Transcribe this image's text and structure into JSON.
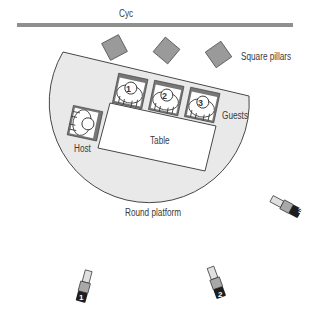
{
  "diagram": {
    "labels": {
      "cyc": "Cyc",
      "pillars": "Square pillars",
      "guests": "Guests",
      "host": "Host",
      "table": "Table",
      "platform": "Round platform"
    },
    "guests": [
      {
        "number": "1"
      },
      {
        "number": "2"
      },
      {
        "number": "3"
      }
    ],
    "cameras": [
      {
        "number": "1"
      },
      {
        "number": "2"
      },
      {
        "number": "3"
      }
    ],
    "colors": {
      "cyc": "#8f8f8f",
      "pillar": "#9a9a9a",
      "platform": "#e9e9e9",
      "outline": "#333333",
      "chair": "#777777",
      "camera_body": "#a8a8a8",
      "camera_tag": "#1e1e1e"
    }
  }
}
